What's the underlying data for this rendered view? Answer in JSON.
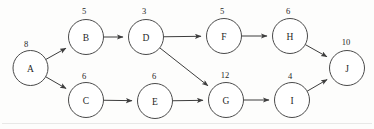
{
  "diagram": {
    "type": "directed-acyclic-graph",
    "background_color": "#fdfdfc",
    "node_stroke_color": "#4a4a4a",
    "edge_color": "#3d3d3d",
    "text_color": "#1f1f1f",
    "node_radius": 17.5,
    "nodes": [
      {
        "id": "A",
        "label": "A",
        "weight": "8",
        "cx": 30.5,
        "cy": 68,
        "wx": 26,
        "wy": 44
      },
      {
        "id": "B",
        "label": "B",
        "weight": "5",
        "cx": 86,
        "cy": 37,
        "wx": 84,
        "wy": 11
      },
      {
        "id": "C",
        "label": "C",
        "weight": "6",
        "cx": 86,
        "cy": 100,
        "wx": 84,
        "wy": 76
      },
      {
        "id": "D",
        "label": "D",
        "weight": "3",
        "cx": 146,
        "cy": 37,
        "wx": 144,
        "wy": 11
      },
      {
        "id": "E",
        "label": "E",
        "weight": "6",
        "cx": 155,
        "cy": 101,
        "wx": 154,
        "wy": 76
      },
      {
        "id": "F",
        "label": "F",
        "weight": "5",
        "cx": 224,
        "cy": 36,
        "wx": 222,
        "wy": 11
      },
      {
        "id": "G",
        "label": "G",
        "weight": "12",
        "cx": 226,
        "cy": 100,
        "wx": 225,
        "wy": 75
      },
      {
        "id": "H",
        "label": "H",
        "weight": "6",
        "cx": 290,
        "cy": 36,
        "wx": 288,
        "wy": 11
      },
      {
        "id": "I",
        "label": "I",
        "weight": "4",
        "cx": 292,
        "cy": 100,
        "wx": 290,
        "wy": 76
      },
      {
        "id": "J",
        "label": "J",
        "weight": "10",
        "cx": 347,
        "cy": 68,
        "wx": 346,
        "wy": 42
      }
    ],
    "edges": [
      {
        "from": "A",
        "to": "B"
      },
      {
        "from": "A",
        "to": "C"
      },
      {
        "from": "B",
        "to": "D"
      },
      {
        "from": "C",
        "to": "E"
      },
      {
        "from": "D",
        "to": "F"
      },
      {
        "from": "D",
        "to": "G"
      },
      {
        "from": "E",
        "to": "G"
      },
      {
        "from": "F",
        "to": "H"
      },
      {
        "from": "G",
        "to": "I"
      },
      {
        "from": "H",
        "to": "J"
      },
      {
        "from": "I",
        "to": "J"
      }
    ]
  }
}
